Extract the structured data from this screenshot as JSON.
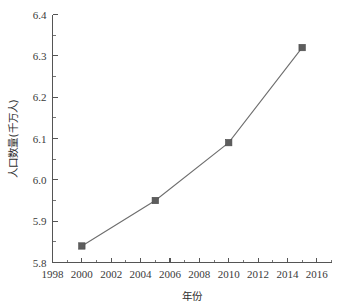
{
  "chart_data": {
    "type": "line",
    "title": "",
    "xlabel": "年份",
    "ylabel": "人口数量(千万人)",
    "x": [
      2000,
      2005,
      2010,
      2015
    ],
    "values": [
      5.84,
      5.95,
      6.09,
      6.32
    ],
    "series": [
      {
        "name": "人口数量",
        "values": [
          5.84,
          5.95,
          6.09,
          6.32
        ]
      }
    ],
    "xlim": [
      1998,
      2017
    ],
    "ylim": [
      5.8,
      6.4
    ],
    "x_ticks": [
      1998,
      2000,
      2002,
      2004,
      2006,
      2008,
      2010,
      2012,
      2014,
      2016
    ],
    "x_tick_labels": [
      "1998",
      "2000",
      "2002",
      "2004",
      "2006",
      "2008",
      "2010",
      "2012",
      "2014",
      "2016"
    ],
    "x_minor_step": 1,
    "y_ticks": [
      5.8,
      5.9,
      6.0,
      6.1,
      6.2,
      6.3,
      6.4
    ],
    "y_tick_labels": [
      "5.8",
      "5.9",
      "6.0",
      "6.1",
      "6.2",
      "6.3",
      "6.4"
    ],
    "y_minor_step": 0.05,
    "grid": false,
    "legend": false,
    "legend_position": "none",
    "marker": "square",
    "line_color": "#6e6e6e",
    "marker_color": "#5d5d5d",
    "axis_color": "#555555",
    "background": "#ffffff",
    "annotations": []
  }
}
